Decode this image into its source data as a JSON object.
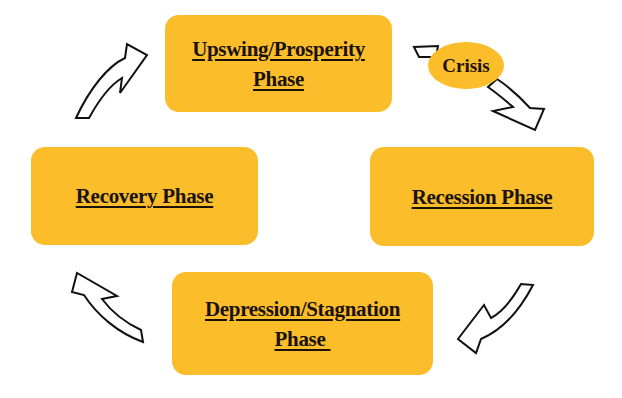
{
  "diagram": {
    "colors": {
      "box_fill": "#fbbd2a",
      "text": "#1a1208",
      "arrow_stroke": "#111111",
      "arrow_fill": "#ffffff",
      "background": "#ffffff"
    },
    "phases": {
      "upswing": {
        "line1": "Upswing/Prosperity",
        "line2": "Phase"
      },
      "recession": {
        "line1": "Recession Phase"
      },
      "depression": {
        "line1": "Depression/Stagnation",
        "line2": "Phase "
      },
      "recovery": {
        "line1": "Recovery Phase"
      }
    },
    "crisis": {
      "label": "Crisis"
    },
    "arrows": [
      {
        "from": "Recovery Phase",
        "to": "Upswing/Prosperity Phase",
        "direction": "up-right"
      },
      {
        "from": "Upswing/Prosperity Phase",
        "to": "Recession Phase",
        "direction": "down-right",
        "via": "Crisis"
      },
      {
        "from": "Recession Phase",
        "to": "Depression/Stagnation Phase",
        "direction": "down-left"
      },
      {
        "from": "Depression/Stagnation Phase",
        "to": "Recovery Phase",
        "direction": "up-left"
      }
    ]
  }
}
